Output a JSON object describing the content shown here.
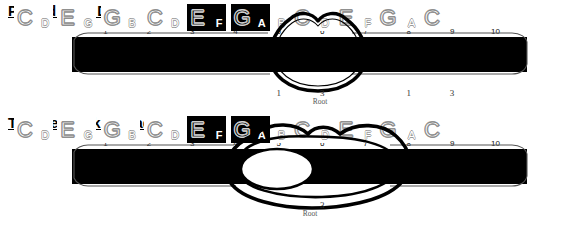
{
  "page": {
    "background": "#ffffff",
    "width": 570,
    "height": 225
  },
  "diagrams": [
    {
      "id": "pursed-lip",
      "title": "Pursed Lip F Dyad",
      "mouth_style": "pursed-lips",
      "tongue_visible": false,
      "hole_numbers": [
        "1",
        "2",
        "3",
        "4",
        "5",
        "6",
        "7",
        "8",
        "9",
        "10"
      ],
      "holes": [
        {
          "number": "1",
          "blow": "C",
          "draw": "D",
          "layout": "blow-left",
          "active": false
        },
        {
          "number": "2",
          "blow": "E",
          "draw": "G",
          "layout": "blow-left",
          "active": false
        },
        {
          "number": "3",
          "blow": "G",
          "draw": "B",
          "layout": "blow-left",
          "active": false
        },
        {
          "number": "4",
          "blow": "C",
          "draw": "D",
          "layout": "blow-left",
          "active": false
        },
        {
          "number": "5",
          "blow": "E",
          "draw": "F",
          "layout": "blow-left",
          "active": true
        },
        {
          "number": "6",
          "blow": "G",
          "draw": "A",
          "layout": "blow-left",
          "active": true
        },
        {
          "number": "7",
          "blow": "C",
          "draw": "B",
          "layout": "blow-right",
          "active": false
        },
        {
          "number": "8",
          "blow": "E",
          "draw": "D",
          "layout": "blow-right",
          "active": false
        },
        {
          "number": "9",
          "blow": "G",
          "draw": "F",
          "layout": "blow-right",
          "active": false
        },
        {
          "number": "10",
          "blow": "C",
          "draw": "A",
          "layout": "blow-right",
          "active": false
        }
      ],
      "degree_labels": [
        {
          "text": "1",
          "hole": 5
        },
        {
          "text": "3",
          "hole": 6
        },
        {
          "text": "1",
          "hole": 8
        },
        {
          "text": "3",
          "hole": 9
        }
      ],
      "root_label": "Root"
    },
    {
      "id": "tongue-block",
      "title": "Tongue Block F Dyad",
      "mouth_style": "open-mouth-with-tongue",
      "tongue_visible": true,
      "hole_numbers": [
        "1",
        "2",
        "3",
        "4",
        "5",
        "6",
        "7",
        "8",
        "9",
        "10"
      ],
      "holes": [
        {
          "number": "1",
          "blow": "C",
          "draw": "D",
          "layout": "blow-left",
          "active": false
        },
        {
          "number": "2",
          "blow": "E",
          "draw": "G",
          "layout": "blow-left",
          "active": false
        },
        {
          "number": "3",
          "blow": "G",
          "draw": "B",
          "layout": "blow-left",
          "active": false
        },
        {
          "number": "4",
          "blow": "C",
          "draw": "D",
          "layout": "blow-left",
          "active": false
        },
        {
          "number": "5",
          "blow": "E",
          "draw": "F",
          "layout": "blow-left",
          "active": true
        },
        {
          "number": "6",
          "blow": "G",
          "draw": "A",
          "layout": "blow-left",
          "active": true
        },
        {
          "number": "7",
          "blow": "C",
          "draw": "B",
          "layout": "blow-right",
          "active": false
        },
        {
          "number": "8",
          "blow": "E",
          "draw": "D",
          "layout": "blow-right",
          "active": false
        },
        {
          "number": "9",
          "blow": "G",
          "draw": "F",
          "layout": "blow-right",
          "active": false
        },
        {
          "number": "10",
          "blow": "C",
          "draw": "A",
          "layout": "blow-right",
          "active": false
        }
      ],
      "degree_labels": [
        {
          "text": "3",
          "hole": 6
        }
      ],
      "root_label": "Root"
    }
  ]
}
